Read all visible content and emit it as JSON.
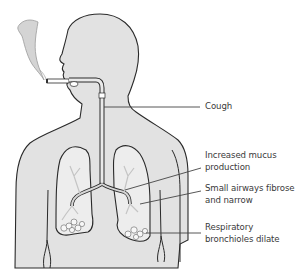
{
  "diagram": {
    "colors": {
      "body_fill": "#e2e2e2",
      "outline": "#2a2a2a",
      "lung_fill": "#ededed",
      "airway": "#c8c8c8",
      "smoke": "#cfcfcf",
      "leader_line": "#444444",
      "label_text": "#3a3a3a",
      "background": "#ffffff"
    },
    "labels": [
      {
        "id": "cough",
        "lines": [
          "Cough"
        ]
      },
      {
        "id": "mucus",
        "lines": [
          "Increased mucus",
          "production"
        ]
      },
      {
        "id": "airways",
        "lines": [
          "Small airways fibrose",
          "and narrow"
        ]
      },
      {
        "id": "bronchioles",
        "lines": [
          "Respiratory",
          "bronchioles dilate"
        ]
      }
    ]
  }
}
